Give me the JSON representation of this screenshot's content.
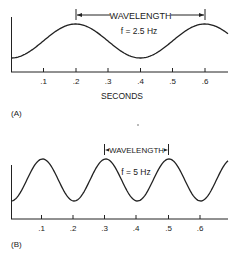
{
  "panel_a": {
    "label": "(A)",
    "wavelength_label": "WAVELENGTH",
    "frequency_label": "f = 2.5 Hz",
    "x_axis_title": "SECONDS",
    "ticks": [
      ".1",
      ".2",
      ".3",
      ".4",
      ".5",
      ".6"
    ]
  },
  "panel_b": {
    "label": "(B)",
    "wavelength_label": "WAVELENGTH",
    "frequency_label": "f = 5 Hz",
    "ticks": [
      ".1",
      ".2",
      ".3",
      ".4",
      ".5",
      ".6"
    ]
  },
  "colors": {
    "ink": "#222222",
    "background": "#ffffff"
  }
}
